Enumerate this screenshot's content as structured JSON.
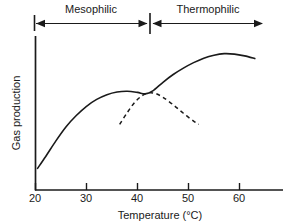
{
  "chart_data": {
    "type": "line",
    "title": "",
    "xlabel": "Temperature (°C)",
    "ylabel": "Gas production",
    "xlim": [
      20,
      65.5
    ],
    "ylim": [
      0,
      1
    ],
    "grid": false,
    "legend": "none",
    "xticks": [
      20,
      30,
      40,
      50,
      60
    ],
    "xtick_labels": [
      "20",
      "30",
      "40",
      "50",
      "60"
    ],
    "yticks": [],
    "ytick_labels": [],
    "series": [
      {
        "name": "mesophilic-then-thermophilic-envelope",
        "style": "solid",
        "color": "#1a1a1a",
        "points": [
          [
            20.4,
            0.145
          ],
          [
            22.0,
            0.225
          ],
          [
            24.0,
            0.33
          ],
          [
            26.0,
            0.425
          ],
          [
            28.0,
            0.5
          ],
          [
            30.0,
            0.562
          ],
          [
            32.0,
            0.608
          ],
          [
            34.0,
            0.64
          ],
          [
            36.0,
            0.658
          ],
          [
            38.0,
            0.663
          ],
          [
            40.0,
            0.655
          ],
          [
            41.5,
            0.645
          ],
          [
            43.0,
            0.665
          ],
          [
            45.0,
            0.723
          ],
          [
            47.0,
            0.775
          ],
          [
            49.0,
            0.818
          ],
          [
            51.0,
            0.855
          ],
          [
            53.0,
            0.885
          ],
          [
            55.0,
            0.905
          ],
          [
            57.0,
            0.915
          ],
          [
            59.0,
            0.912
          ],
          [
            61.0,
            0.9
          ],
          [
            63.0,
            0.882
          ]
        ]
      },
      {
        "name": "mesophilic-decline",
        "style": "dashed",
        "color": "#1a1a1a",
        "points": [
          [
            36.5,
            0.44
          ],
          [
            38.0,
            0.52
          ],
          [
            39.5,
            0.59
          ],
          [
            41.0,
            0.635
          ],
          [
            42.2,
            0.652
          ],
          [
            43.5,
            0.648
          ],
          [
            45.0,
            0.622
          ],
          [
            47.0,
            0.572
          ],
          [
            49.0,
            0.515
          ],
          [
            51.0,
            0.462
          ],
          [
            52.0,
            0.44
          ]
        ]
      }
    ],
    "annotations": [
      {
        "name": "mesophilic-range",
        "label": "Mesophilic",
        "type": "double-arrow",
        "from": 20,
        "to": 42,
        "position": "top"
      },
      {
        "name": "thermophilic-range",
        "label": "Thermophilic",
        "type": "double-arrow",
        "from": 42,
        "to": 64,
        "position": "top"
      },
      {
        "name": "range-divider",
        "label": "",
        "type": "tick",
        "at": 42,
        "position": "top"
      }
    ]
  },
  "axes": {
    "y_title": "Gas production",
    "x_title": "Temperature (°C)",
    "x_tick_labels": [
      "20",
      "30",
      "40",
      "50",
      "60"
    ]
  },
  "bands": {
    "mesophilic_label": "Mesophilic",
    "thermophilic_label": "Thermophilic"
  },
  "colors": {
    "ink": "#1a1a1a",
    "background": "#ffffff"
  }
}
